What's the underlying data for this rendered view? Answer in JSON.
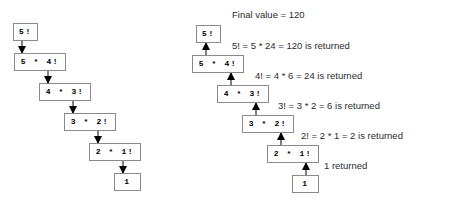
{
  "diagram": {
    "colors": {
      "box_border": "#8a8a8a",
      "box_fill": "#ffffff",
      "arrow": "#000000",
      "text": "#1a1a1a",
      "background": "#ffffff"
    },
    "left_panel": {
      "name": "descent-phase",
      "arrow_direction": "down",
      "nodes": [
        {
          "label": "5!",
          "x": 13,
          "y": 23,
          "w": 25,
          "h": 18
        },
        {
          "label": "5 * 4!",
          "x": 14,
          "y": 53,
          "w": 52,
          "h": 18
        },
        {
          "label": "4 * 3!",
          "x": 39,
          "y": 83,
          "w": 52,
          "h": 18
        },
        {
          "label": "3 * 2!",
          "x": 64,
          "y": 113,
          "w": 52,
          "h": 18
        },
        {
          "label": "2 * 1!",
          "x": 89,
          "y": 143,
          "w": 52,
          "h": 18
        },
        {
          "label": "1",
          "x": 114,
          "y": 173,
          "w": 27,
          "h": 18
        }
      ],
      "arrows": [
        {
          "x": 22,
          "y1": 41,
          "y2": 53
        },
        {
          "x": 48,
          "y1": 71,
          "y2": 83
        },
        {
          "x": 73,
          "y1": 101,
          "y2": 113
        },
        {
          "x": 98,
          "y1": 131,
          "y2": 143
        },
        {
          "x": 123,
          "y1": 161,
          "y2": 173
        }
      ]
    },
    "right_panel": {
      "name": "return-phase",
      "arrow_direction": "up",
      "nodes": [
        {
          "label": "5!",
          "x": 196,
          "y": 25,
          "w": 25,
          "h": 18
        },
        {
          "label": "5 * 4!",
          "x": 192,
          "y": 55,
          "w": 52,
          "h": 18
        },
        {
          "label": "4 * 3!",
          "x": 217,
          "y": 85,
          "w": 52,
          "h": 18
        },
        {
          "label": "3 * 2!",
          "x": 242,
          "y": 115,
          "w": 52,
          "h": 18
        },
        {
          "label": "2 * 1!",
          "x": 267,
          "y": 145,
          "w": 52,
          "h": 18
        },
        {
          "label": "1",
          "x": 292,
          "y": 175,
          "w": 27,
          "h": 18
        }
      ],
      "arrows": [
        {
          "x": 206,
          "y1": 55,
          "y2": 43
        },
        {
          "x": 231,
          "y1": 85,
          "y2": 73
        },
        {
          "x": 256,
          "y1": 115,
          "y2": 103
        },
        {
          "x": 281,
          "y1": 145,
          "y2": 133
        },
        {
          "x": 306,
          "y1": 175,
          "y2": 163
        }
      ],
      "annotations": [
        {
          "text": "Final value = 120",
          "x": 232,
          "y": 10
        },
        {
          "text": "5! = 5 * 24 = 120 is returned",
          "x": 232,
          "y": 41
        },
        {
          "text": "4! = 4 * 6 = 24 is returned",
          "x": 255,
          "y": 71
        },
        {
          "text": "3! = 3 * 2 = 6 is returned",
          "x": 278,
          "y": 101
        },
        {
          "text": "2! = 2 * 1 = 2 is returned",
          "x": 301,
          "y": 131
        },
        {
          "text": "1 returned",
          "x": 324,
          "y": 161
        }
      ]
    }
  }
}
